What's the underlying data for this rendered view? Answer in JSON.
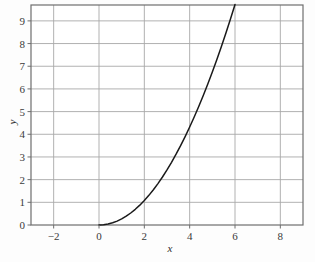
{
  "chart_data": {
    "type": "line",
    "title": "",
    "xlabel": "x",
    "ylabel": "y",
    "xlim": [
      -3,
      9
    ],
    "ylim": [
      0,
      9.7
    ],
    "grid": true,
    "legend": null,
    "x_ticks": [
      -2,
      0,
      2,
      4,
      6,
      8
    ],
    "x_tick_labels": [
      "−2",
      "0",
      "2",
      "4",
      "6",
      "8"
    ],
    "y_ticks": [
      0,
      1,
      2,
      3,
      4,
      5,
      6,
      7,
      8,
      9
    ],
    "y_tick_labels": [
      "0",
      "1",
      "2",
      "3",
      "4",
      "5",
      "6",
      "7",
      "8",
      "9"
    ],
    "x_minor_gridlines": [
      -2,
      0,
      2,
      4,
      6,
      8
    ],
    "y_minor_gridlines": [
      1,
      2,
      3,
      4,
      5,
      6,
      7,
      8,
      9
    ],
    "series": [
      {
        "name": "curve",
        "color": "#1a1a1a",
        "x": [
          0.0,
          0.2,
          0.4,
          0.6,
          0.8,
          1.0,
          1.2,
          1.4,
          1.6,
          1.8,
          2.0,
          2.2,
          2.4,
          2.6,
          2.8,
          3.0,
          3.2,
          3.4,
          3.6,
          3.8,
          4.0,
          4.2,
          4.4,
          4.6,
          4.8,
          5.0,
          5.2,
          5.4,
          5.6,
          5.8,
          6.0
        ],
        "y": [
          0.0,
          0.03,
          0.09,
          0.18,
          0.3,
          0.42,
          0.56,
          0.73,
          0.92,
          1.13,
          1.95,
          1.62,
          1.88,
          2.17,
          2.47,
          2.78,
          3.12,
          3.48,
          3.87,
          4.27,
          5.2,
          5.1,
          5.55,
          6.02,
          6.52,
          7.0,
          7.51,
          8.05,
          8.6,
          9.15,
          9.7
        ]
      }
    ],
    "colors": {
      "curve": "#1a1a1a",
      "grid": "#a8a8a8",
      "frame": "#6e6e6e",
      "background": "#fdfdfd",
      "text": "#3a3a3a"
    }
  }
}
